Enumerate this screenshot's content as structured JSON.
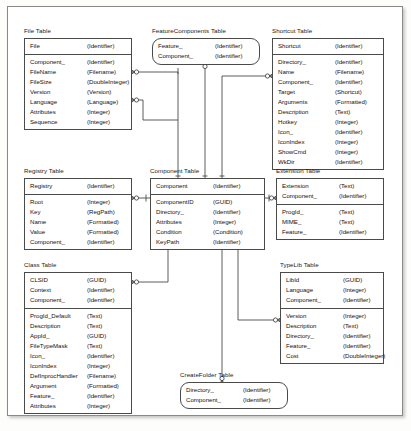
{
  "diagram": {
    "type": "entity-relationship",
    "notation": "crow's-foot (zero-or-many) / single-bar (exactly-one)",
    "background_color": "#ffffff",
    "line_color": "#4a4a48",
    "text_color": "#111111"
  },
  "entities": {
    "file": {
      "title": "File Table",
      "shape": "rectangle",
      "keys": [
        {
          "name": "File",
          "type": "(Identifier)"
        }
      ],
      "attributes": [
        {
          "name": "Component_",
          "type": "(Identifier)"
        },
        {
          "name": "FileName",
          "type": "(Filename)"
        },
        {
          "name": "FileSize",
          "type": "(DoubleInteger)"
        },
        {
          "name": "Version",
          "type": "(Version)"
        },
        {
          "name": "Language",
          "type": "(Language)"
        },
        {
          "name": "Attributes",
          "type": "(Integer)"
        },
        {
          "name": "Sequence",
          "type": "(Integer)"
        }
      ]
    },
    "featurecomponents": {
      "title": "FeatureComponents Table",
      "shape": "rounded-rectangle",
      "keys": [
        {
          "name": "Feature_",
          "type": "(Identifier)"
        },
        {
          "name": "Component_",
          "type": "(Identifier)"
        }
      ],
      "attributes": []
    },
    "shortcut": {
      "title": "Shortcut Table",
      "shape": "rectangle",
      "keys": [
        {
          "name": "Shortcut",
          "type": "(Identifier)"
        }
      ],
      "attributes": [
        {
          "name": "Directory_",
          "type": "(Identifier)"
        },
        {
          "name": "Name",
          "type": "(Filename)"
        },
        {
          "name": "Component_",
          "type": "(Identifier)"
        },
        {
          "name": "Target",
          "type": "(Shortcut)"
        },
        {
          "name": "Arguments",
          "type": "(Formatted)"
        },
        {
          "name": "Description",
          "type": "(Text)"
        },
        {
          "name": "Hotkey",
          "type": "(Integer)"
        },
        {
          "name": "Icon_",
          "type": "(Identifier)"
        },
        {
          "name": "IconIndex",
          "type": "(Integer)"
        },
        {
          "name": "ShowCmd",
          "type": "(Integer)"
        },
        {
          "name": "WkDir",
          "type": "(Identifier)"
        }
      ]
    },
    "registry": {
      "title": "Registry Table",
      "shape": "rectangle",
      "keys": [
        {
          "name": "Registry",
          "type": "(Identifier)"
        }
      ],
      "attributes": [
        {
          "name": "Root",
          "type": "(Integer)"
        },
        {
          "name": "Key",
          "type": "(RegPath)"
        },
        {
          "name": "Name",
          "type": "(Formatted)"
        },
        {
          "name": "Value",
          "type": "(Formatted)"
        },
        {
          "name": "Component_",
          "type": "(Identifier)"
        }
      ]
    },
    "component": {
      "title": "Component Table",
      "shape": "rectangle",
      "keys": [
        {
          "name": "Component",
          "type": "(Identifier)"
        }
      ],
      "attributes": [
        {
          "name": "ComponentID",
          "type": "(GUID)"
        },
        {
          "name": "Directory_",
          "type": "(Identifier)"
        },
        {
          "name": "Attributes",
          "type": "(Integer)"
        },
        {
          "name": "Condition",
          "type": "(Condition)"
        },
        {
          "name": "KeyPath",
          "type": "(Identifier)"
        }
      ]
    },
    "extension": {
      "title": "Extension Table",
      "shape": "rectangle",
      "keys": [
        {
          "name": "Extension",
          "type": "(Text)"
        },
        {
          "name": "Component_",
          "type": "(Identifier)"
        }
      ],
      "attributes": [
        {
          "name": "ProgId_",
          "type": "(Text)"
        },
        {
          "name": "MIME_",
          "type": "(Text)"
        },
        {
          "name": "Feature_",
          "type": "(Identifier)"
        }
      ]
    },
    "class": {
      "title": "Class Table",
      "shape": "rectangle",
      "keys": [
        {
          "name": "CLSID",
          "type": "(GUID)"
        },
        {
          "name": "Context",
          "type": "(Identifier)"
        },
        {
          "name": "Component_",
          "type": "(Identifier)"
        }
      ],
      "attributes": [
        {
          "name": "ProgId_Default",
          "type": "(Text)"
        },
        {
          "name": "Description",
          "type": "(Text)"
        },
        {
          "name": "AppId_",
          "type": "(GUID)"
        },
        {
          "name": "FileTypeMask",
          "type": "(Text)"
        },
        {
          "name": "Icon_",
          "type": "(Identifier)"
        },
        {
          "name": "IconIndex",
          "type": "(Integer)"
        },
        {
          "name": "DefInprocHandler",
          "type": "(Filename)"
        },
        {
          "name": "Argument",
          "type": "(Formatted)"
        },
        {
          "name": "Feature_",
          "type": "(Identifier)"
        },
        {
          "name": "Attributes",
          "type": "(Integer)"
        }
      ]
    },
    "typelib": {
      "title": "TypeLib Table",
      "shape": "rectangle",
      "keys": [
        {
          "name": "LibId",
          "type": "(GUID)"
        },
        {
          "name": "Language",
          "type": "(Integer)"
        },
        {
          "name": "Component_",
          "type": "(Identifier)"
        }
      ],
      "attributes": [
        {
          "name": "Version",
          "type": "(Integer)"
        },
        {
          "name": "Description",
          "type": "(Text)"
        },
        {
          "name": "Directory_",
          "type": "(Identifier)"
        },
        {
          "name": "Feature_",
          "type": "(Identifier)"
        },
        {
          "name": "Cost",
          "type": "(DoubleInteger)"
        }
      ]
    },
    "createfolder": {
      "title": "CreateFolder Table",
      "shape": "rounded-rectangle",
      "keys": [
        {
          "name": "Directory_",
          "type": "(Identifier)"
        },
        {
          "name": "Component_",
          "type": "(Identifier)"
        }
      ],
      "attributes": []
    }
  },
  "relationships": [
    {
      "from": "component",
      "to": "file",
      "label": ""
    },
    {
      "from": "component",
      "to": "featurecomponents",
      "label": ""
    },
    {
      "from": "component",
      "to": "shortcut",
      "label": ""
    },
    {
      "from": "component",
      "to": "registry",
      "label": ""
    },
    {
      "from": "component",
      "to": "extension",
      "label": ""
    },
    {
      "from": "component",
      "to": "class",
      "label": ""
    },
    {
      "from": "component",
      "to": "typelib",
      "label": ""
    },
    {
      "from": "component",
      "to": "createfolder",
      "label": ""
    }
  ]
}
